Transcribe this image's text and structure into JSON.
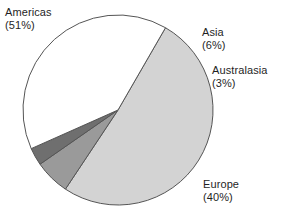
{
  "chart_data": {
    "type": "pie",
    "title": "",
    "subtitle": "",
    "xlabel": "",
    "ylabel": "",
    "legend_position": "none",
    "grid": false,
    "units": "percent",
    "total": 100,
    "start_angle_deg": -60,
    "direction": "clockwise",
    "categories": [
      "Americas",
      "Asia",
      "Australasia",
      "Europe"
    ],
    "values": [
      51,
      6,
      3,
      40
    ],
    "slices": [
      {
        "label": "Americas",
        "value": 51,
        "value_text": "(51%)",
        "color": "#d3d3d3",
        "label_position": "outside-top-left"
      },
      {
        "label": "Asia",
        "value": 6,
        "value_text": "(6%)",
        "color": "#9a9a9a",
        "label_position": "outside-top-right"
      },
      {
        "label": "Australasia",
        "value": 3,
        "value_text": "(3%)",
        "color": "#6f6f6f",
        "label_position": "outside-right"
      },
      {
        "label": "Europe",
        "value": 40,
        "value_text": "(40%)",
        "color": "#ffffff",
        "label_position": "outside-bottom-right"
      }
    ],
    "stroke_color": "#555555",
    "background": "#ffffff"
  },
  "labels": {
    "americas": {
      "name": "Americas",
      "pct": "(51%)"
    },
    "asia": {
      "name": "Asia",
      "pct": "(6%)"
    },
    "australasia": {
      "name": "Australasia",
      "pct": "(3%)"
    },
    "europe": {
      "name": "Europe",
      "pct": "(40%)"
    }
  }
}
